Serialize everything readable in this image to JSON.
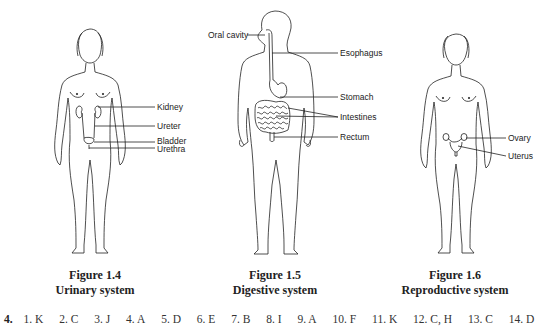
{
  "figures": [
    {
      "id": "1.4",
      "caption_number": "Figure 1.4",
      "caption_title": "Urinary system",
      "labels": [
        "Kidney",
        "Ureter",
        "Bladder",
        "Urethra"
      ]
    },
    {
      "id": "1.5",
      "caption_number": "Figure 1.5",
      "caption_title": "Digestive system",
      "labels": [
        "Oral cavity",
        "Esophagus",
        "Stomach",
        "Intestines",
        "Rectum"
      ]
    },
    {
      "id": "1.6",
      "caption_number": "Figure 1.6",
      "caption_title": "Reproductive system",
      "labels": [
        "Ovary",
        "Uterus"
      ]
    }
  ],
  "answers": {
    "question_number": "4.",
    "items": [
      "1. K",
      "2. C",
      "3. J",
      "4. A",
      "5. D",
      "6. E",
      "7. B",
      "8. I",
      "9. A",
      "10. F",
      "11. K",
      "12. C, H",
      "13. C",
      "14. D"
    ]
  }
}
